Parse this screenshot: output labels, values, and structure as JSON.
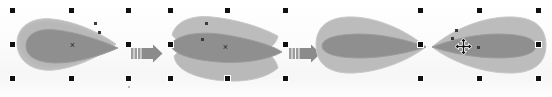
{
  "document": {
    "title": "Shape transform sequence",
    "canvas_background": "#fdfdfd",
    "description": "Vector drawing app canvas shown in three successive states separated by block arrows"
  },
  "palette": {
    "shape_light": "#b7b7b7",
    "shape_light_edge": "#c6c6c6",
    "shape_dark": "#8c8c8c",
    "shape_dark_edge": "#9a9a9a",
    "handle_fill": "#101010",
    "handle_outline": "#ffffff",
    "arrow_fill": "#8b8b8b",
    "arrow_stripe": "#9d9d9d",
    "cursor_fill": "#1a1a1a",
    "node_fill": "#3b3b3b"
  },
  "stages": [
    {
      "id": "stage-1",
      "label": "Original grouped shapes",
      "selection": {
        "visible": true,
        "handle_count": 8,
        "bounds_label": "selection-bounds-1"
      },
      "center_marker": "x",
      "shapes": [
        {
          "name": "petal-back-light",
          "fill": "#b7b7b7"
        },
        {
          "name": "petal-front-dark",
          "fill": "#8c8c8c"
        }
      ]
    },
    {
      "id": "stage-2",
      "label": "Shapes rotated into crossed position",
      "selection": {
        "visible": true,
        "handle_count": 8,
        "bounds_label": "selection-bounds-2"
      },
      "center_marker": "x",
      "shapes": [
        {
          "name": "petal-back-light",
          "fill": "#b7b7b7"
        },
        {
          "name": "petal-front-dark",
          "fill": "#8c8c8c"
        }
      ]
    },
    {
      "id": "stage-3",
      "label": "Shapes mirrored into bow-tie arrangement",
      "selection": {
        "visible": true,
        "handle_count": 8,
        "bounds_label": "selection-bounds-3"
      },
      "center_marker": "x",
      "shapes": [
        {
          "name": "petal-left-mirrored",
          "fill": "#b7b7b7"
        },
        {
          "name": "petal-right-light",
          "fill": "#b7b7b7"
        },
        {
          "name": "petal-right-dark",
          "fill": "#8c8c8c"
        }
      ]
    }
  ],
  "arrows": [
    {
      "id": "arrow-1",
      "name": "step-arrow-right",
      "glyph": "→",
      "stripes": 3
    },
    {
      "id": "arrow-2",
      "name": "step-arrow-right",
      "glyph": "→",
      "stripes": 3
    }
  ],
  "cursor": {
    "name": "move-cursor",
    "glyph": "✛",
    "type": "four-way-move"
  }
}
